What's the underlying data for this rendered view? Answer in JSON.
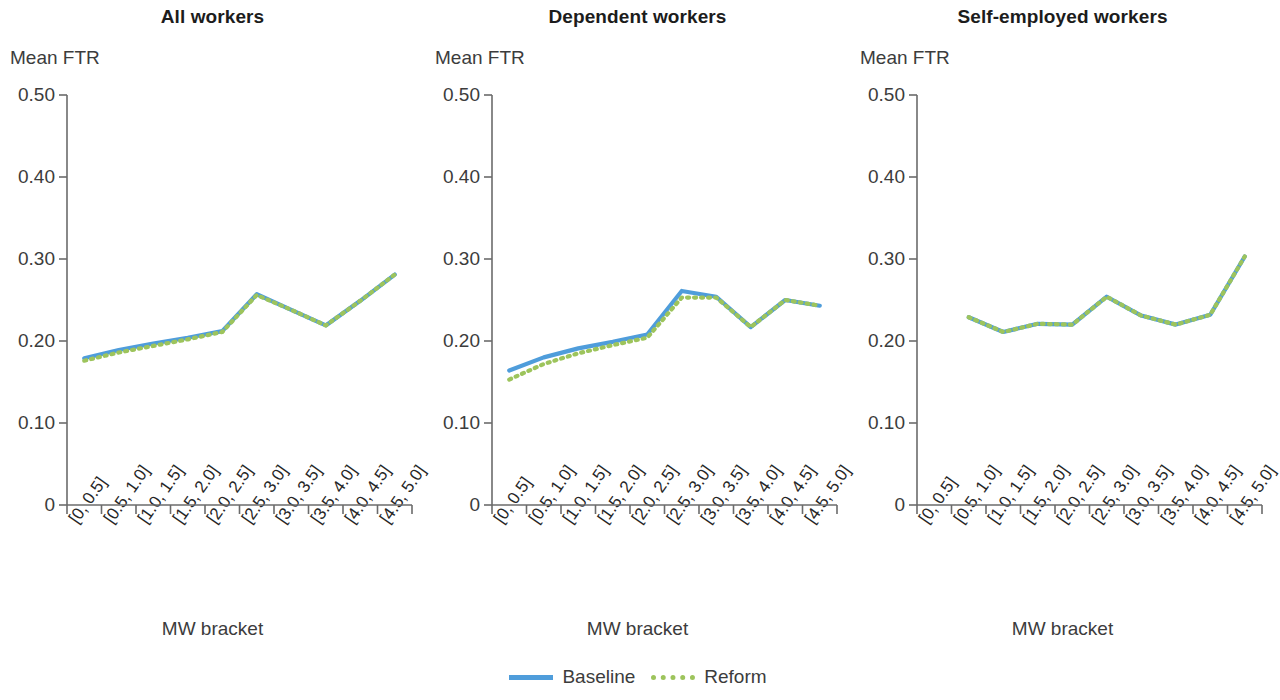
{
  "figure": {
    "ylabel": "Mean FTR",
    "xlabel": "MW bracket",
    "y_ticks": [
      "0.50",
      "0.40",
      "0.30",
      "0.20",
      "0.10",
      "0"
    ],
    "x_ticks": [
      "[0, 0.5]",
      "[0.5, 1.0]",
      "[1.0, 1.5]",
      "[1.5, 2.0]",
      "[2.0, 2.5]",
      "[2.5, 3.0]",
      "[3.0, 3.5]",
      "[3.5, 4.0]",
      "[4.0, 4.5]",
      "[4.5, 5.0]"
    ],
    "legend": [
      {
        "label": "Baseline",
        "style": "solid",
        "color": "#4f9ddb"
      },
      {
        "label": "Reform",
        "style": "dotted",
        "color": "#9dc45c"
      }
    ]
  },
  "colors": {
    "baseline": "#4f9ddb",
    "reform": "#9dc45c",
    "axis": "#6b6b6b",
    "title": "#1c1c1c",
    "text": "#3c3c3c"
  },
  "chart_data": [
    {
      "type": "line",
      "title": "All workers",
      "xlabel": "MW bracket",
      "ylabel": "Mean FTR",
      "ylim": [
        0,
        0.5
      ],
      "yticks": [
        0,
        0.1,
        0.2,
        0.3,
        0.4,
        0.5
      ],
      "grid": false,
      "legend_position": "bottom-center",
      "categories": [
        "[0, 0.5]",
        "[0.5, 1.0]",
        "[1.0, 1.5]",
        "[1.5, 2.0]",
        "[2.0, 2.5]",
        "[2.5, 3.0]",
        "[3.0, 3.5]",
        "[3.5, 4.0]",
        "[4.0, 4.5]",
        "[4.5, 5.0]"
      ],
      "series": [
        {
          "name": "Baseline",
          "values": [
            0.179,
            0.189,
            0.197,
            0.204,
            0.212,
            0.257,
            0.238,
            0.219,
            0.249,
            0.281
          ]
        },
        {
          "name": "Reform",
          "values": [
            0.176,
            0.186,
            0.194,
            0.202,
            0.211,
            0.256,
            0.238,
            0.219,
            0.249,
            0.281
          ]
        }
      ]
    },
    {
      "type": "line",
      "title": "Dependent workers",
      "xlabel": "MW bracket",
      "ylabel": "Mean FTR",
      "ylim": [
        0,
        0.5
      ],
      "yticks": [
        0,
        0.1,
        0.2,
        0.3,
        0.4,
        0.5
      ],
      "grid": false,
      "legend_position": "bottom-center",
      "categories": [
        "[0, 0.5]",
        "[0.5, 1.0]",
        "[1.0, 1.5]",
        "[1.5, 2.0]",
        "[2.0, 2.5]",
        "[2.5, 3.0]",
        "[3.0, 3.5]",
        "[3.5, 4.0]",
        "[4.0, 4.5]",
        "[4.5, 5.0]"
      ],
      "series": [
        {
          "name": "Baseline",
          "values": [
            0.164,
            0.18,
            0.191,
            0.199,
            0.208,
            0.261,
            0.254,
            0.217,
            0.25,
            0.243
          ]
        },
        {
          "name": "Reform",
          "values": [
            0.153,
            0.172,
            0.185,
            0.195,
            0.204,
            0.253,
            0.253,
            0.217,
            0.25,
            0.243
          ]
        }
      ]
    },
    {
      "type": "line",
      "title": "Self-employed workers",
      "xlabel": "MW bracket",
      "ylabel": "Mean FTR",
      "ylim": [
        0,
        0.5
      ],
      "yticks": [
        0,
        0.1,
        0.2,
        0.3,
        0.4,
        0.5
      ],
      "grid": false,
      "legend_position": "bottom-center",
      "categories": [
        "[0, 0.5]",
        "[0.5, 1.0]",
        "[1.0, 1.5]",
        "[1.5, 2.0]",
        "[2.0, 2.5]",
        "[2.5, 3.0]",
        "[3.0, 3.5]",
        "[3.5, 4.0]",
        "[4.0, 4.5]",
        "[4.5, 5.0]"
      ],
      "series": [
        {
          "name": "Baseline",
          "values": [
            null,
            0.229,
            0.211,
            0.221,
            0.22,
            0.254,
            0.231,
            0.22,
            0.232,
            0.303
          ]
        },
        {
          "name": "Reform",
          "values": [
            null,
            0.229,
            0.211,
            0.221,
            0.22,
            0.254,
            0.231,
            0.22,
            0.232,
            0.303
          ]
        }
      ]
    }
  ]
}
